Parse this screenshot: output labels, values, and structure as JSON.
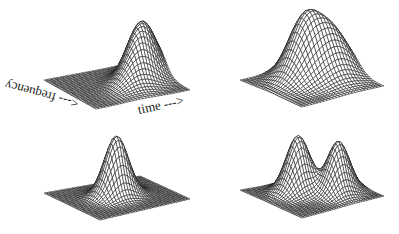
{
  "figure": {
    "background": "#ffffff",
    "line_color": "#1a1a1a",
    "axis_labels": {
      "frequency": "<--- frequency",
      "time": "time --->"
    }
  },
  "panels": [
    {
      "id": "top-left",
      "shape": "single-peak",
      "base": {
        "left": [
          44,
          80
        ],
        "right": [
          190,
          90
        ],
        "front": [
          96,
          109
        ],
        "back": [
          140,
          62
        ]
      },
      "peaks": [
        {
          "u": 0.62,
          "v": 0.35,
          "height": 58,
          "su": 0.09,
          "sv": 0.16
        }
      ],
      "grid": {
        "nu": 34,
        "nv": 30
      }
    },
    {
      "id": "top-right",
      "shape": "two-ridge",
      "base": {
        "left": [
          240,
          80
        ],
        "right": [
          384,
          86
        ],
        "front": [
          302,
          107
        ],
        "back": [
          322,
          64
        ]
      },
      "peaks": [
        {
          "u": 0.42,
          "v": 0.38,
          "height": 55,
          "su": 0.11,
          "sv": 0.15
        },
        {
          "u": 0.62,
          "v": 0.32,
          "height": 44,
          "su": 0.12,
          "sv": 0.16
        }
      ],
      "grid": {
        "nu": 30,
        "nv": 26
      }
    },
    {
      "id": "bottom-left",
      "shape": "single-peak-coarse",
      "base": {
        "left": [
          44,
          193
        ],
        "right": [
          190,
          199
        ],
        "front": [
          100,
          220
        ],
        "back": [
          140,
          176
        ]
      },
      "peaks": [
        {
          "u": 0.48,
          "v": 0.48,
          "height": 60,
          "su": 0.08,
          "sv": 0.09
        }
      ],
      "grid": {
        "nu": 34,
        "nv": 34
      }
    },
    {
      "id": "bottom-right",
      "shape": "double-peak-coarse",
      "base": {
        "left": [
          240,
          190
        ],
        "right": [
          384,
          196
        ],
        "front": [
          302,
          218
        ],
        "back": [
          330,
          175
        ]
      },
      "peaks": [
        {
          "u": 0.38,
          "v": 0.45,
          "height": 56,
          "su": 0.08,
          "sv": 0.1
        },
        {
          "u": 0.66,
          "v": 0.45,
          "height": 52,
          "su": 0.08,
          "sv": 0.1
        }
      ],
      "grid": {
        "nu": 34,
        "nv": 34
      }
    }
  ]
}
